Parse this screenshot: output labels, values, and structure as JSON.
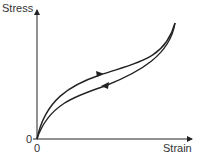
{
  "diagram": {
    "y_axis_label": "Stress",
    "x_axis_label": "Strain",
    "y_origin_label": "0",
    "x_origin_label": "0",
    "curves": [
      {
        "name": "loading",
        "direction": "increasing strain"
      },
      {
        "name": "unloading",
        "direction": "decreasing strain"
      }
    ]
  }
}
